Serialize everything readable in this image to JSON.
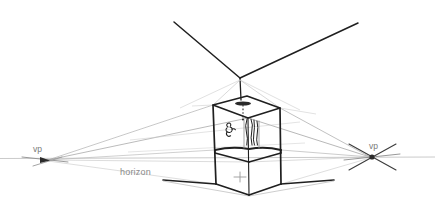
{
  "drawing": {
    "title": "Three-point perspective construction sketch",
    "background_color": "#ffffff",
    "labels": {
      "vp_left": "vp",
      "vp_right": "vp",
      "horizon": "horizon"
    },
    "colors": {
      "ink_dark": "#1c1c1c",
      "ink_mid": "#4a4a4a",
      "guide_gray": "#9a9a9a",
      "guide_light": "#bfbfbf",
      "horizon_gray": "#b4b4b4",
      "text_gray": "#7a7a7a"
    },
    "vanishing_points": {
      "left": {
        "x": 45,
        "y": 160,
        "label": "vp"
      },
      "right": {
        "x": 372,
        "y": 157,
        "label": "vp"
      },
      "vertical_apex": {
        "x": 240,
        "y": 78
      }
    },
    "horizon_line": {
      "y": 158,
      "x_start": 0,
      "x_end": 435
    },
    "box": {
      "top_left": {
        "x": 213,
        "y": 105
      },
      "top_back": {
        "x": 247,
        "y": 96
      },
      "top_right": {
        "x": 280,
        "y": 108
      },
      "top_front": {
        "x": 248,
        "y": 118
      },
      "mid_left": {
        "x": 215,
        "y": 150
      },
      "mid_front": {
        "x": 249,
        "y": 162
      },
      "mid_right": {
        "x": 281,
        "y": 150
      },
      "bottom_left": {
        "x": 216,
        "y": 184
      },
      "bottom_front": {
        "x": 249,
        "y": 195
      },
      "bottom_right": {
        "x": 281,
        "y": 184
      },
      "front_face_mark": {
        "x": 240,
        "y": 177,
        "glyph": "+"
      }
    },
    "interior": {
      "ceiling_fixture": {
        "x": 243,
        "y": 103
      },
      "pendant_dotted": true,
      "figure_sketch": true,
      "curtain_sketch": true
    },
    "ground_lines": {
      "left": {
        "x1": 163,
        "y1": 180,
        "x2": 216,
        "y2": 184
      },
      "right": {
        "x1": 281,
        "y1": 184,
        "x2": 333,
        "y2": 180
      }
    }
  }
}
